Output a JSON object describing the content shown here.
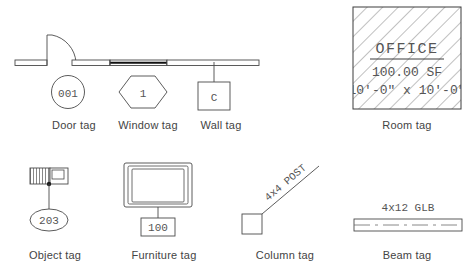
{
  "legend": {
    "title_visible": false,
    "stroke_color": "#4a4a4a",
    "text_color": "#444444",
    "background": "#ffffff"
  },
  "row1": {
    "door": {
      "caption": "Door tag",
      "tag_number": "001",
      "symbol_shape": "circle"
    },
    "window": {
      "caption": "Window tag",
      "tag_number": "1",
      "symbol_shape": "hexagon"
    },
    "wall": {
      "caption": "Wall tag",
      "tag_number": "C",
      "symbol_shape": "square"
    },
    "room": {
      "caption": "Room tag",
      "room_name": "OFFICE",
      "room_area": "100.00 SF",
      "room_dimensions": "10'-0\" x 10'-0\"",
      "symbol_shape": "hatched-square"
    }
  },
  "row2": {
    "object": {
      "caption": "Object tag",
      "tag_number": "203",
      "symbol_shape": "ellipse"
    },
    "furniture": {
      "caption": "Furniture tag",
      "tag_number": "100",
      "symbol_shape": "square"
    },
    "column": {
      "caption": "Column tag",
      "tag_label": "4x4 POST",
      "symbol_shape": "square-with-leader"
    },
    "beam": {
      "caption": "Beam tag",
      "tag_label": "4x12 GLB",
      "symbol_shape": "beam-centerline"
    }
  }
}
